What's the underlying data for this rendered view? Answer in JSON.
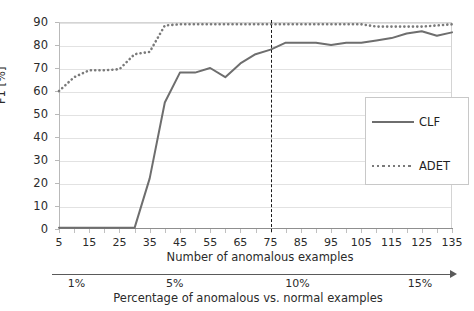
{
  "chart_data": {
    "type": "line",
    "title": "",
    "xlabel": "Number of anomalous examples",
    "ylabel": "F1 [%]",
    "ylim": [
      0,
      90
    ],
    "xlim": [
      5,
      135
    ],
    "grid": true,
    "legend_position": "right",
    "yticks": [
      0,
      10,
      20,
      30,
      40,
      50,
      60,
      70,
      80,
      90
    ],
    "xticks": [
      5,
      15,
      25,
      35,
      45,
      55,
      65,
      75,
      85,
      95,
      105,
      115,
      125,
      135
    ],
    "x": [
      5,
      10,
      15,
      20,
      25,
      30,
      35,
      40,
      45,
      50,
      55,
      60,
      65,
      70,
      75,
      80,
      85,
      90,
      95,
      100,
      105,
      110,
      115,
      120,
      125,
      130,
      135
    ],
    "series": [
      {
        "name": "CLF",
        "style": "solid",
        "color": "#6e6e6e",
        "values": [
          0.5,
          0.5,
          0.5,
          0.5,
          0.5,
          0.5,
          22,
          55,
          68,
          68,
          70,
          66,
          72,
          76,
          78,
          81,
          81,
          81,
          80,
          81,
          81,
          82,
          83,
          85,
          86,
          84,
          85.5
        ]
      },
      {
        "name": "ADET",
        "style": "dotted",
        "color": "#7a7a7a",
        "values": [
          60,
          66,
          69,
          69,
          69.5,
          76,
          77,
          88.5,
          89,
          89,
          89,
          89,
          89,
          89,
          89,
          89,
          89,
          89,
          89,
          89,
          89,
          88,
          88,
          88,
          88,
          88.5,
          89
        ]
      }
    ],
    "annotations": [
      {
        "type": "vline",
        "x": 75,
        "style": "dashed",
        "color": "#1a1a1a"
      }
    ],
    "secondary_axis": {
      "label": "Percentage of anomalous vs. normal examples",
      "ticks": [
        {
          "label": "1%",
          "at": 1
        },
        {
          "label": "5%",
          "at": 5
        },
        {
          "label": "10%",
          "at": 10
        },
        {
          "label": "15%",
          "at": 15
        }
      ],
      "arrow": true
    }
  },
  "legend": {
    "entries": [
      {
        "label": "CLF"
      },
      {
        "label": "ADET"
      }
    ]
  }
}
